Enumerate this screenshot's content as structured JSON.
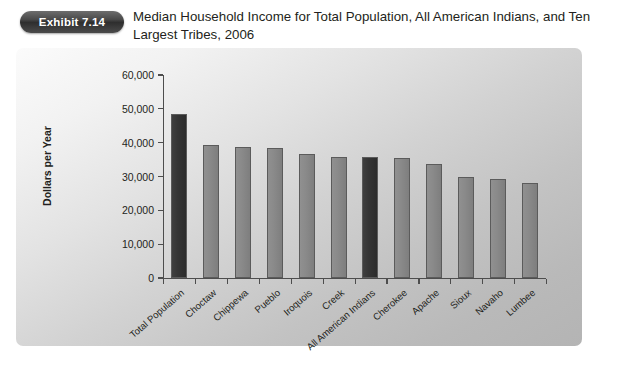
{
  "badge": {
    "label": "Exhibit 7.14"
  },
  "title": "Median Household Income for Total Population, All American Indians, and Ten Largest Tribes, 2006",
  "chart_data": {
    "type": "bar",
    "title": "Median Household Income for Total Population, All American Indians, and Ten Largest Tribes, 2006",
    "xlabel": "",
    "ylabel": "Dollars per Year",
    "ylim": [
      0,
      60000
    ],
    "ytick_labels": [
      "0",
      "10,000",
      "20,000",
      "30,000",
      "40,000",
      "50,000",
      "60,000"
    ],
    "ytick_values": [
      0,
      10000,
      20000,
      30000,
      40000,
      50000,
      60000
    ],
    "grid": false,
    "legend": "none",
    "categories": [
      "Total Population",
      "Choctaw",
      "Chippewa",
      "Pueblo",
      "Iroquois",
      "Creek",
      "All American Indians",
      "Cherokee",
      "Apache",
      "Sioux",
      "Navaho",
      "Lumbee"
    ],
    "values": [
      48500,
      39400,
      38800,
      38500,
      36700,
      35800,
      35800,
      35500,
      33700,
      29900,
      29300,
      28100
    ],
    "highlight_indices": [
      0,
      6
    ],
    "colors": {
      "bar": "#8a8a8a",
      "bar_highlight": "#333333",
      "bar_border": "#5b5b5b",
      "axis": "#4d4d4d",
      "panel_background": "#d2d2d2",
      "text": "#231f20",
      "badge_background": "#3a3a3a",
      "badge_text": "#ffffff"
    }
  }
}
